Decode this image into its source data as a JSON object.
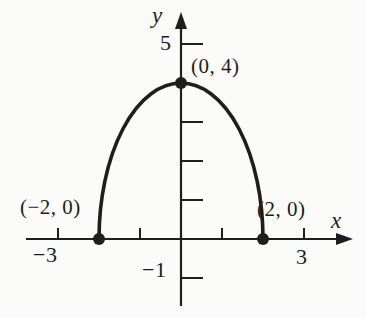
{
  "figure": {
    "background_color": "#fbfbf9",
    "ink_color": "#1e1e1e"
  },
  "labels": {
    "x_axis": "x",
    "y_axis": "y",
    "tick_5": "5",
    "tick_neg1": "−1",
    "tick_neg3": "−3",
    "tick_3": "3",
    "point_top": "(0, 4)",
    "point_left": "(−2, 0)",
    "point_right": "(2, 0)"
  },
  "chart_data": {
    "type": "line",
    "title": "",
    "curve": {
      "equation": "y = 2*sqrt(4 - x^2)",
      "x_from": -2,
      "x_to": 2
    },
    "points": [
      {
        "x": -2,
        "y": 0,
        "label": "(−2, 0)"
      },
      {
        "x": 0,
        "y": 4,
        "label": "(0, 4)"
      },
      {
        "x": 2,
        "y": 0,
        "label": "(2, 0)"
      }
    ],
    "x_axis": {
      "label": "x",
      "ticks": [
        -3,
        -1,
        1,
        3
      ],
      "labeled_ticks": [
        -3,
        3
      ],
      "range_shown": [
        -3.8,
        4.0
      ]
    },
    "y_axis": {
      "label": "y",
      "ticks": [
        -1,
        1,
        2,
        3,
        5
      ],
      "labeled_ticks": [
        5,
        -1
      ],
      "range_shown": [
        -1.9,
        5.8
      ]
    },
    "grid": false,
    "legend": false
  }
}
